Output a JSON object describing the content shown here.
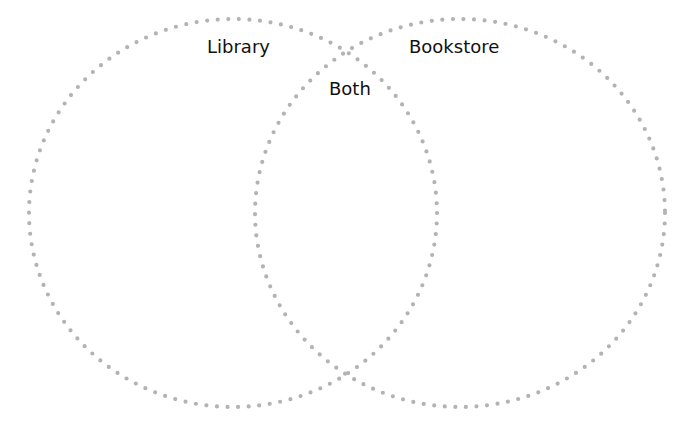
{
  "diagram": {
    "type": "venn",
    "dot_color": "#b3b3b3",
    "circles": [
      {
        "id": "library",
        "label": "Library",
        "cx": 233,
        "cy": 213,
        "rx": 204,
        "ry": 194
      },
      {
        "id": "bookstore",
        "label": "Bookstore",
        "cx": 460,
        "cy": 213,
        "rx": 205,
        "ry": 194
      }
    ],
    "intersection_label": "Both"
  }
}
